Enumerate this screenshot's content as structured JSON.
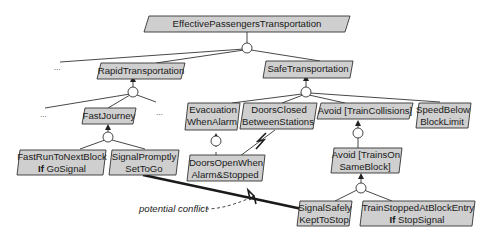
{
  "diagram": {
    "type": "goal-refinement-graph",
    "colors": {
      "goal_fill": "#cfcfcf",
      "stroke": "#333333",
      "background": "#ffffff"
    },
    "goals": [
      {
        "id": "g_epti",
        "lines": [
          "EffectivePassengersTransportation"
        ]
      },
      {
        "id": "g_rapid",
        "lines": [
          "RapidTransportation"
        ]
      },
      {
        "id": "g_safe",
        "lines": [
          "SafeTransportation"
        ]
      },
      {
        "id": "g_fast",
        "lines": [
          "FastJourney"
        ]
      },
      {
        "id": "g_evac",
        "lines": [
          "Evacuation",
          "WhenAlarm"
        ]
      },
      {
        "id": "g_doorsclosed",
        "lines": [
          "DoorsClosed",
          "BetweenStations"
        ]
      },
      {
        "id": "g_avoidcoll",
        "lines": [
          "Avoid [TrainCollisions]"
        ]
      },
      {
        "id": "g_speed",
        "lines": [
          "SpeedBelow",
          "BlockLimit"
        ]
      },
      {
        "id": "g_fastrun",
        "lines": [
          "FastRunToNextBlock",
          "If GoSignal"
        ],
        "bold_prefix": "If"
      },
      {
        "id": "g_sigprompt",
        "lines": [
          "SignalPromptly",
          "SetToGo"
        ]
      },
      {
        "id": "g_doorsopen",
        "lines": [
          "DoorsOpenWhen",
          "Alarm&Stopped"
        ]
      },
      {
        "id": "g_avoidsame",
        "lines": [
          "Avoid [TrainsOn",
          "SameBlock]"
        ]
      },
      {
        "id": "g_sigsafe",
        "lines": [
          "SignalSafely",
          "KeptToStop"
        ]
      },
      {
        "id": "g_trainstopped",
        "lines": [
          "TrainStoppedAtBlockEntry",
          "If StopSignal"
        ],
        "bold_prefix": "If"
      }
    ],
    "ellipses": [
      "...",
      "...",
      "...",
      "..."
    ],
    "annotation": "potential conflict",
    "conflicts": [
      {
        "from": "SignalPromptly SetToGo",
        "to": "SignalSafely KeptToStop",
        "label": "potential conflict"
      },
      {
        "from": "DoorsClosed BetweenStations",
        "to": "DoorsOpenWhen Alarm&Stopped"
      }
    ],
    "refinements": [
      {
        "parent": "EffectivePassengersTransportation",
        "children": [
          "RapidTransportation",
          "SafeTransportation",
          "..."
        ]
      },
      {
        "parent": "RapidTransportation",
        "children": [
          "FastJourney",
          "...",
          "..."
        ]
      },
      {
        "parent": "SafeTransportation",
        "children": [
          "EvacuationWhenAlarm",
          "DoorsClosedBetweenStations",
          "Avoid [TrainCollisions]",
          "SpeedBelowBlockLimit"
        ]
      },
      {
        "parent": "FastJourney",
        "children": [
          "FastRunToNextBlock If GoSignal",
          "SignalPromptlySetToGo"
        ]
      },
      {
        "parent": "EvacuationWhenAlarm",
        "children": [
          "DoorsOpenWhenAlarm&Stopped"
        ]
      },
      {
        "parent": "Avoid [TrainCollisions]",
        "children": [
          "Avoid [TrainsOnSameBlock]"
        ]
      },
      {
        "parent": "Avoid [TrainsOnSameBlock]",
        "children": [
          "SignalSafelyKeptToStop",
          "TrainStoppedAtBlockEntry If StopSignal"
        ]
      }
    ]
  }
}
